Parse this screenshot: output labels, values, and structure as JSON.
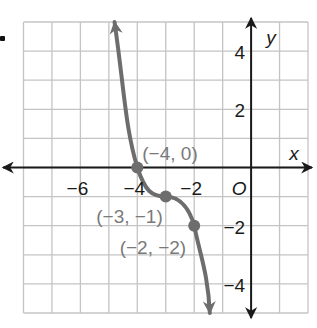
{
  "chart_data": {
    "type": "line",
    "title": "",
    "xlabel": "x",
    "ylabel": "y",
    "origin_label": "O",
    "xlim": [
      -8,
      2
    ],
    "ylim": [
      -5,
      5
    ],
    "grid": true,
    "x_ticks": [
      {
        "value": -6,
        "label": "−6"
      },
      {
        "value": -4,
        "label": "−4"
      },
      {
        "value": -2,
        "label": "−2"
      }
    ],
    "y_ticks": [
      {
        "value": 4,
        "label": "4"
      },
      {
        "value": 2,
        "label": "2"
      },
      {
        "value": -2,
        "label": "−2"
      },
      {
        "value": -4,
        "label": "−4"
      }
    ],
    "series": [
      {
        "name": "cubic curve",
        "color": "#6d6d6d",
        "points": [
          {
            "x": -4.8,
            "y": 5
          },
          {
            "x": -4,
            "y": 0
          },
          {
            "x": -3,
            "y": -1
          },
          {
            "x": -2,
            "y": -2
          },
          {
            "x": -1.45,
            "y": -5
          }
        ],
        "arrows": "both ends"
      }
    ],
    "annotations": [
      {
        "x": -4,
        "y": 0,
        "label": "(−4, 0)"
      },
      {
        "x": -3,
        "y": -1,
        "label": "(−3, −1)"
      },
      {
        "x": -2,
        "y": -2,
        "label": "(−2, −2)"
      }
    ]
  },
  "colors": {
    "grid": "#c4c4c4",
    "axis": "#1a1a1a",
    "curve": "#6d6d6d",
    "label_gray": "#7a7a7a"
  }
}
